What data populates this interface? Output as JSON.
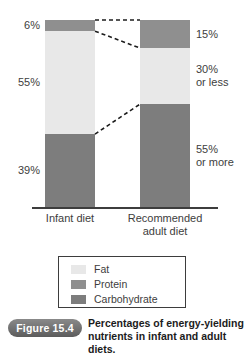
{
  "chart_data": {
    "type": "bar",
    "subtype": "stacked-100-percent",
    "title": "Percentages of energy-yielding nutrients in infant and adult diets.",
    "xlabel": "",
    "ylabel": "",
    "ylim": [
      0,
      100
    ],
    "grid": false,
    "legend_position": "bottom",
    "categories": [
      "Infant diet",
      "Recommended adult diet"
    ],
    "stack_order_top_to_bottom": [
      "Protein",
      "Fat",
      "Carbohydrate"
    ],
    "series": [
      {
        "name": "Protein",
        "values": [
          6,
          15
        ],
        "color": "#8f8f8f"
      },
      {
        "name": "Fat",
        "values": [
          55,
          30
        ],
        "color": "#e8e8e8"
      },
      {
        "name": "Carbohydrate",
        "values": [
          39,
          55
        ],
        "color": "#7d7d7d"
      }
    ],
    "data_labels": {
      "Infant diet": {
        "Protein": "6%",
        "Fat": "55%",
        "Carbohydrate": "39%"
      },
      "Recommended adult diet": {
        "Protein": "15%",
        "Fat": "30%\nor less",
        "Carbohydrate": "55%\nor more"
      }
    },
    "annotations": [
      "Dashed leader line connecting top of Infant diet bar to top of Recommended adult diet bar",
      "Dashed leader line connecting Infant diet protein/fat boundary to Recommended adult diet protein/fat boundary",
      "Dashed leader line connecting Infant diet fat/carbohydrate boundary to Recommended adult diet fat/carbohydrate boundary"
    ]
  },
  "plot": {
    "left_labels": {
      "protein": "6%",
      "fat": "55%",
      "carbohydrate": "39%"
    },
    "right_labels": {
      "protein": "15%",
      "fat_line1": "30%",
      "fat_line2": "or less",
      "carbohydrate_line1": "55%",
      "carbohydrate_line2": "or more"
    },
    "category_labels": {
      "left_line1": "Infant diet",
      "right_line1": "Recommended",
      "right_line2": "adult diet"
    }
  },
  "legend": {
    "items": [
      {
        "label": "Fat",
        "color": "#e8e8e8"
      },
      {
        "label": "Protein",
        "color": "#8f8f8f"
      },
      {
        "label": "Carbohydrate",
        "color": "#7d7d7d"
      }
    ]
  },
  "caption": {
    "badge": "Figure 15.4",
    "line1": "Percentages of energy-yielding",
    "line2": "nutrients in infant and adult diets."
  },
  "colors": {
    "fat": "#e8e8e8",
    "protein": "#8f8f8f",
    "carbohydrate": "#7d7d7d",
    "axis": "#3d3d3d",
    "text": "#3d3d3d",
    "badge": "#6e6e6e",
    "background": "#ffffff"
  }
}
